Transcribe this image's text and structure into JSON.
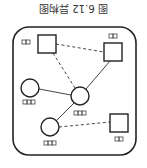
{
  "figure": {
    "title": "图 6.12 异构图",
    "orientation": "rotated-180",
    "colors": {
      "stroke": "#222222",
      "background": "#ffffff",
      "text": "#333333"
    }
  },
  "graph": {
    "nodes": [
      {
        "id": "A",
        "shape": "square",
        "label_glyphs": 2
      },
      {
        "id": "B",
        "shape": "square",
        "label_glyphs": 2
      },
      {
        "id": "C",
        "shape": "circle",
        "label_glyphs": 3
      },
      {
        "id": "D",
        "shape": "circle",
        "label_glyphs": 3
      },
      {
        "id": "E",
        "shape": "circle",
        "label_glyphs": 3
      },
      {
        "id": "F",
        "shape": "square",
        "label_glyphs": 2
      }
    ],
    "edges": [
      {
        "from": "A",
        "to": "B",
        "style": "dashed"
      },
      {
        "from": "A",
        "to": "D",
        "style": "dashed"
      },
      {
        "from": "B",
        "to": "D",
        "style": "solid"
      },
      {
        "from": "C",
        "to": "D",
        "style": "solid"
      },
      {
        "from": "D",
        "to": "E",
        "style": "solid"
      },
      {
        "from": "E",
        "to": "F",
        "style": "dashed"
      }
    ]
  }
}
